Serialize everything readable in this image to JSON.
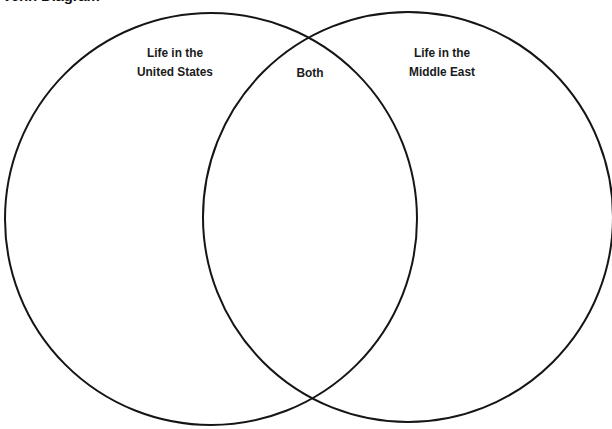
{
  "title": "Venn Diagram",
  "diagram": {
    "type": "venn",
    "stroke_color": "#151515",
    "sets": [
      {
        "id": "left",
        "label_lines": [
          "Life in the",
          "United States"
        ]
      },
      {
        "id": "right",
        "label_lines": [
          "Life in the",
          "Middle East"
        ]
      }
    ],
    "intersection": {
      "label": "Both"
    }
  }
}
